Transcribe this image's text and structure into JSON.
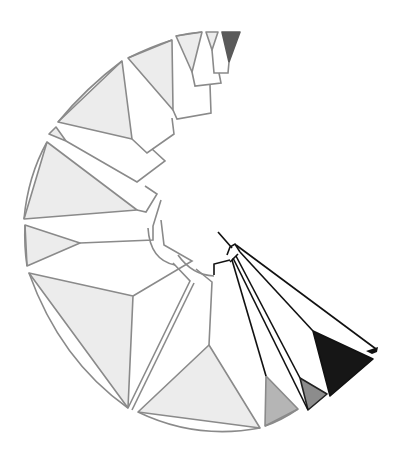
{
  "diagram": {
    "type": "circular-phylogenetic-tree",
    "width": 404,
    "height": 464,
    "colors": {
      "background": "#ffffff",
      "clade_light": "#ececec",
      "clade_stroke_gray": "#8a8a8a",
      "clade_mid": "#b5b5b5",
      "clade_dark_gray": "#8c8c8c",
      "clade_darker": "#5a5a5a",
      "clade_black": "#161616",
      "branch_black": "#111111"
    },
    "collapsed_clades": [
      {
        "id": "c1",
        "fill": "#5a5a5a",
        "stroke": "#5a5a5a",
        "points": "222,32 240,32 229,62"
      },
      {
        "id": "c2",
        "fill": "#ececec",
        "stroke": "#8a8a8a",
        "points": "206,32 218,32 212,50"
      },
      {
        "id": "c3",
        "fill": "#ececec",
        "stroke": "#8a8a8a",
        "points": "176,36 202,32 192,72"
      },
      {
        "id": "c4",
        "fill": "#ececec",
        "stroke": "#8a8a8a",
        "points": "128,58 172,40 173,110"
      },
      {
        "id": "c5",
        "fill": "#ececec",
        "stroke": "#8a8a8a",
        "points": "58,122 122,61 132,139"
      },
      {
        "id": "c6",
        "fill": "#ececec",
        "stroke": "#8a8a8a",
        "points": "49,134 56,127 66,141"
      },
      {
        "id": "c7",
        "fill": "#ececec",
        "stroke": "#8a8a8a",
        "points": "24,219 47,142 137,210"
      },
      {
        "id": "c8",
        "fill": "#ececec",
        "stroke": "#8a8a8a",
        "points": "25,225 80,243 27,266"
      },
      {
        "id": "c9",
        "fill": "#ececec",
        "stroke": "#8a8a8a",
        "points": "29,273 133,296 128,408"
      },
      {
        "id": "c10",
        "fill": "#ececec",
        "stroke": "#8a8a8a",
        "points": "138,412 209,345 260,428"
      },
      {
        "id": "c11",
        "fill": "#b5b5b5",
        "stroke": "#8a8a8a",
        "points": "265,426 266,376 298,409"
      },
      {
        "id": "c12",
        "fill": "#8c8c8c",
        "stroke": "#222222",
        "points": "308,410 300,378 327,394"
      },
      {
        "id": "c13",
        "fill": "#161616",
        "stroke": "#111111",
        "points": "330,396 313,331 373,359"
      }
    ],
    "outer_arc": {
      "stroke": "#8a8a8a",
      "segments": [
        "M 176,36 Q 189,33 202,32",
        "M 128,58 Q 150,47 172,40",
        "M 58,122 Q 86,88 122,61",
        "M 24,219 Q 28,176 47,142",
        "M 25,225 Q 24,246 27,266",
        "M 29,273 Q 60,360 128,408",
        "M 138,412 Q 196,440 260,428",
        "M 265,426 Q 282,420 298,409"
      ]
    },
    "gray_branches": [
      "M 212,50 L 214,73 L 228,73 L 229,62",
      "M 192,72 L 195,86 L 221,83 L 219,73",
      "M 173,110 L 177,119 L 211,113 L 210,85",
      "M 132,139 L 147,153 L 174,134 L 172,118",
      "M 66,141 L 137,182 L 165,161 L 152,149",
      "M 137,210 L 146,212 L 157,194 L 145,186",
      "M 80,243 L 153,240 L 153,226 L 161,200",
      "M 133,296 L 192,261 L 164,245 L 161,220",
      "M 128,408 L 190,281 L 173,263",
      "M 132,410 L 194,283",
      "M 209,345 L 212,282 L 196,269",
      "M 148,228 Q 150,260 175,265",
      "M 178,255 Q 192,275 214,276"
    ],
    "black_branches": [
      "M 214,275 L 214,264 L 230,260",
      "M 218,232 L 232,248",
      "M 227,255 L 230,247 L 235,244 L 240,252",
      "M 230,262 L 238,254",
      "M 233,258 L 308,410",
      "M 236,256 L 300,378",
      "M 232,260 L 266,376",
      "M 240,252 L 313,331",
      "M 236,245 L 376,349"
    ],
    "thick_black_tip": {
      "points": "366,351 378,347 377,352 372,354"
    }
  }
}
